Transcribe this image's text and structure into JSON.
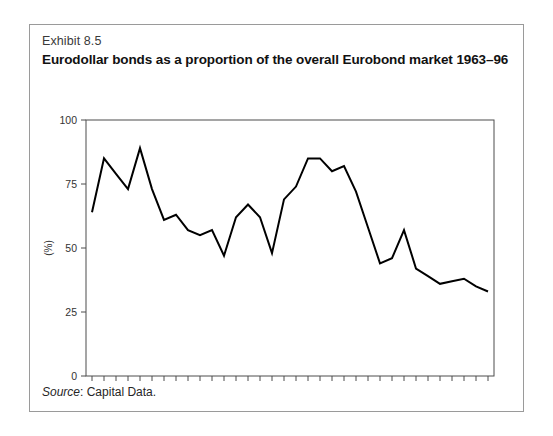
{
  "exhibit": {
    "label": "Exhibit 8.5",
    "title": "Eurodollar bonds as a proportion of the overall Eurobond market 1963–96",
    "source_prefix": "Source",
    "source_text": ": Capital Data."
  },
  "chart_data": {
    "type": "line",
    "title": "Eurodollar bonds as a proportion of the overall Eurobond market 1963–96",
    "xlabel": "",
    "ylabel": "(%)",
    "ylim": [
      0,
      100
    ],
    "yticks": [
      0,
      25,
      50,
      75,
      100
    ],
    "ytick_labels": [
      "0",
      "25",
      "50",
      "75",
      "100"
    ],
    "grid": false,
    "legend": "none",
    "categories": [
      "63",
      "64",
      "65",
      "66",
      "67",
      "68",
      "69",
      "70",
      "71",
      "72",
      "73",
      "74",
      "75",
      "76",
      "77",
      "78",
      "79",
      "80",
      "81",
      "82",
      "83",
      "84",
      "85",
      "86",
      "87",
      "88",
      "89",
      "90",
      "91",
      "92",
      "93",
      "94",
      "95",
      "96"
    ],
    "series": [
      {
        "name": "Eurodollar bonds share of Eurobond market",
        "values": [
          64,
          85,
          79,
          73,
          89,
          73,
          61,
          63,
          57,
          55,
          57,
          47,
          62,
          67,
          62,
          48,
          69,
          74,
          85,
          85,
          80,
          82,
          72,
          58,
          44,
          46,
          57,
          42,
          39,
          36,
          37,
          38,
          35,
          33
        ]
      }
    ],
    "annotations": []
  }
}
